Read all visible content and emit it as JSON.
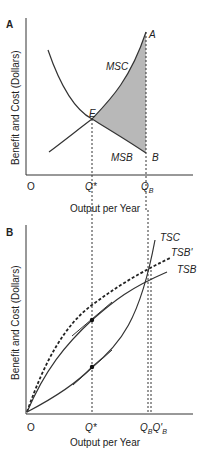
{
  "panel_a": {
    "label": "A",
    "y_axis_label": "Benefit and Cost (Dollars)",
    "x_axis_label": "Output per Year",
    "origin_label": "O",
    "curves": {
      "msc": "MSC",
      "msb": "MSB"
    },
    "points": {
      "e": "E",
      "a": "A",
      "b": "B"
    },
    "x_ticks": {
      "q_star": "Q*",
      "q_b_main": "Q",
      "q_b_sub": "B"
    }
  },
  "panel_b": {
    "label": "B",
    "y_axis_label": "Benefit and Cost (Dollars)",
    "x_axis_label": "Output per Year",
    "origin_label": "O",
    "curves": {
      "tsc": "TSC",
      "tsb_prime": "TSB'",
      "tsb": "TSB"
    },
    "x_ticks": {
      "q_star": "Q*",
      "q_b_main": "Q",
      "q_b_sub": "B",
      "q_b_prime_main": "Q'",
      "q_b_prime_sub": "B"
    }
  },
  "colors": {
    "line": "#333333",
    "shade": "#b8b8b8"
  }
}
